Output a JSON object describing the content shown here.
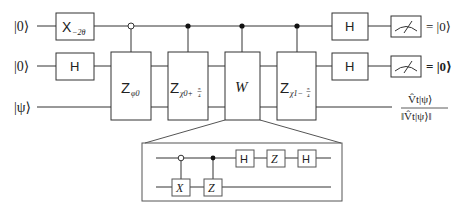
{
  "diagram": {
    "type": "quantum-circuit",
    "inputs": [
      {
        "label": "|0⟩",
        "wire": 1
      },
      {
        "label": "|0⟩",
        "wire": 2
      },
      {
        "label": "|ψ⟩",
        "wire": 3
      }
    ],
    "gates": {
      "x_rot": {
        "base": "X",
        "sub": "−2θ"
      },
      "h_wire2": {
        "label": "H"
      },
      "z_phi0": {
        "base": "Z",
        "sub": "φ0",
        "control": "open"
      },
      "z_chi0": {
        "base": "Z",
        "sub": "χ0+",
        "frac_num": "π",
        "frac_den": "4",
        "control": "filled"
      },
      "w": {
        "label": "W",
        "control": "filled"
      },
      "z_chi1": {
        "base": "Z",
        "sub": "χ1−",
        "frac_num": "π",
        "frac_den": "4",
        "control": "filled"
      },
      "h_out1": {
        "label": "H"
      },
      "h_out2": {
        "label": "H"
      }
    },
    "measurements": [
      "meter-1",
      "meter-2"
    ],
    "outputs": {
      "out1": "= |0⟩",
      "out2": "= |0⟩",
      "out3_num": "V̂t|ψ⟩",
      "out3_den": "‖V̂t|ψ⟩‖"
    },
    "inset": {
      "title": "W decomposition",
      "gates": {
        "x": "X",
        "z_ctrl": "Z",
        "h1": "H",
        "z": "Z",
        "h2": "H"
      }
    }
  }
}
